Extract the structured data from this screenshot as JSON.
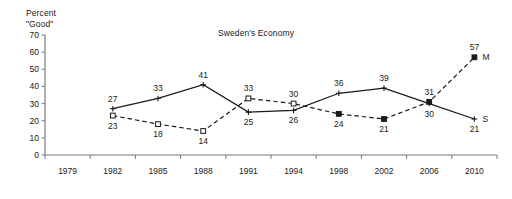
{
  "chart_data": {
    "type": "line",
    "title": "Sweden's Economy",
    "ylabel": "Percent\n\"Good\"",
    "xlabel": "",
    "ylim": [
      0,
      70
    ],
    "yticks": [
      0,
      10,
      20,
      30,
      40,
      50,
      60,
      70
    ],
    "categories": [
      "1979",
      "1982",
      "1985",
      "1988",
      "1991",
      "1994",
      "1998",
      "2002",
      "2006",
      "2010"
    ],
    "grid": false,
    "legend_position": "end-of-line",
    "series": [
      {
        "name": "S",
        "style": "solid",
        "marker": "cross",
        "end_label": "S",
        "values": [
          null,
          27,
          33,
          41,
          25,
          26,
          36,
          39,
          30,
          21
        ],
        "label_positions": [
          "",
          "above",
          "above",
          "above",
          "below",
          "below",
          "above",
          "above",
          "below",
          "below"
        ]
      },
      {
        "name": "M",
        "style": "dashed",
        "marker": "square",
        "end_label": "M",
        "values": [
          null,
          23,
          18,
          14,
          33,
          30,
          24,
          21,
          31,
          57
        ],
        "label_positions": [
          "",
          "below",
          "below",
          "below",
          "above",
          "above",
          "below",
          "below",
          "above",
          "above"
        ]
      }
    ]
  },
  "axis_caption_line1": "Percent",
  "axis_caption_line2": "\"Good\"",
  "colors": {
    "ink": "#1a1a1a",
    "axis": "#7a7a7a",
    "background": "#ffffff"
  }
}
